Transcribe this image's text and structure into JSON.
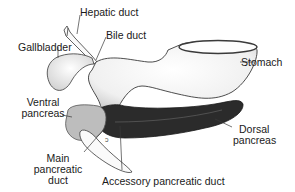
{
  "diagram": {
    "title": "",
    "type": "anatomical illustration",
    "labels": {
      "hepatic_duct": "Hepatic duct",
      "bile_duct": "Bile duct",
      "gallbladder": "Gallbladder",
      "stomach": "Stomach",
      "ventral_pancreas_1": "Ventral",
      "ventral_pancreas_2": "pancreas",
      "dorsal_pancreas_1": "Dorsal",
      "dorsal_pancreas_2": "pancreas",
      "main_duct_1": "Main",
      "main_duct_2": "pancreatic",
      "main_duct_3": "duct",
      "accessory_duct": "Accessory pancreatic duct"
    },
    "colors": {
      "outline": "#3a3a3a",
      "organ_fill": "#f2f2f2",
      "dorsal_pancreas": "#2b2b2b",
      "ventral_pancreas": "#bdbdbd",
      "label_text": "#1a1a1a"
    }
  }
}
